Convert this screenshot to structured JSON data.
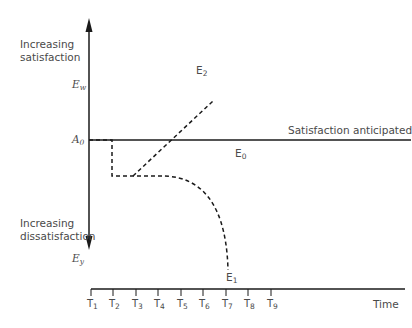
{
  "y_axis": {
    "top_label_line1": "Increasing",
    "top_label_line2": "satisfaction",
    "bottom_label_line1": "Increasing",
    "bottom_label_line2": "dissatisfaction",
    "ew": {
      "base": "E",
      "sub": "w"
    },
    "a0": {
      "base": "A",
      "sub": "0"
    },
    "ey": {
      "base": "E",
      "sub": "y"
    }
  },
  "lines": {
    "anticipated_label": "Satisfaction anticipated",
    "e0": {
      "base": "E",
      "sub": "0"
    },
    "e1": {
      "base": "E",
      "sub": "1"
    },
    "e2": {
      "base": "E",
      "sub": "2"
    }
  },
  "x_axis": {
    "label": "Time",
    "ticks": [
      {
        "base": "T",
        "sub": "1"
      },
      {
        "base": "T",
        "sub": "2"
      },
      {
        "base": "T",
        "sub": "3"
      },
      {
        "base": "T",
        "sub": "4"
      },
      {
        "base": "T",
        "sub": "5"
      },
      {
        "base": "T",
        "sub": "6"
      },
      {
        "base": "T",
        "sub": "7"
      },
      {
        "base": "T",
        "sub": "8"
      },
      {
        "base": "T",
        "sub": "9"
      }
    ]
  },
  "colors": {
    "line": "#1a1a1a",
    "text": "#4a4a4a"
  }
}
